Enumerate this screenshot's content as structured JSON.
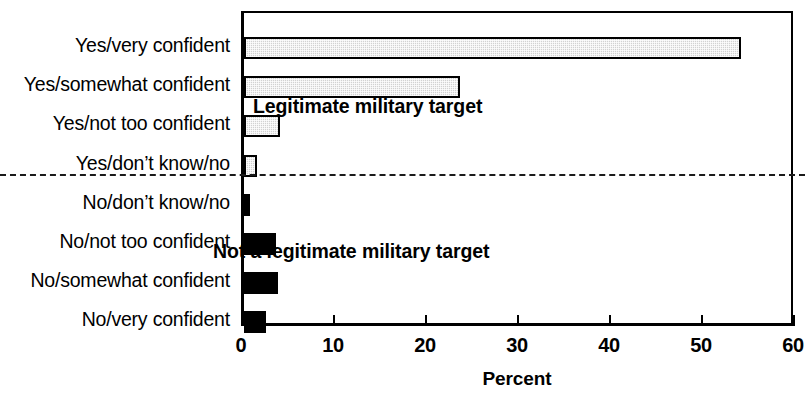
{
  "chart_data": {
    "type": "bar",
    "orientation": "horizontal",
    "title": "",
    "xlabel": "Percent",
    "ylabel": "",
    "xlim": [
      0,
      60
    ],
    "xticks": [
      0,
      10,
      20,
      30,
      40,
      50,
      60
    ],
    "grid": false,
    "legend": null,
    "categories": [
      "Yes/very confident",
      "Yes/somewhat confident",
      "Yes/not too confident",
      "Yes/don’t know/no",
      "No/don’t know/no",
      "No/not too confident",
      "No/somewhat confident",
      "No/very confident"
    ],
    "values": [
      54.0,
      23.5,
      3.9,
      1.4,
      0.7,
      3.5,
      3.7,
      2.4
    ],
    "bar_styles": [
      "gray",
      "gray",
      "gray",
      "gray",
      "black",
      "black",
      "black",
      "black"
    ],
    "annotations": [
      {
        "text": "Legitimate military target",
        "group": "yes"
      },
      {
        "text": "Not a legitimate military target",
        "group": "no"
      }
    ],
    "separator": {
      "style": "dashed",
      "after_category_index": 3
    },
    "colors": {
      "gray_bar_fill": "#d2d2d2",
      "gray_bar_outline": "#000000",
      "black_bar_fill": "#000000",
      "axis": "#000000",
      "background": "#ffffff"
    }
  }
}
